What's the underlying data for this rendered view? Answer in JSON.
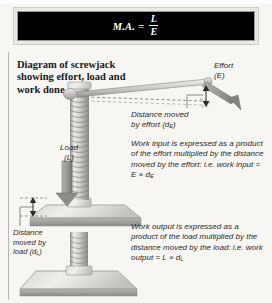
{
  "banner": {
    "formula_lhs": "M.A.",
    "formula_eq": "=",
    "formula_numerator": "L",
    "formula_denominator": "E"
  },
  "title": "Diagram of screwjack showing effort, load and work done",
  "labels": {
    "effort": "Effort (E)",
    "effort_line1": "Effort",
    "effort_line2": "(E)",
    "load_line1": "Load",
    "load_line2": "(L)",
    "distance_moved_by_effort": "Distance moved by effort (dE)",
    "distance_moved_by_load": "Distance moved by load (dL)"
  },
  "paragraphs": {
    "work_input": "Work input is expressed as a product of the effort multiplied by the distance moved by the effort: i.e. work input = E × dE",
    "work_output": "Work output is expressed as a product of the load multiplied by the distance moved by the load: i.e. work output = L × dL"
  },
  "colors": {
    "page_background": "#f7f6f3",
    "banner_background": "#000000",
    "banner_frame": "#e9e8e4",
    "banner_text": "#ffffff",
    "metal_light": "#e4e3e0",
    "metal_mid": "#b9b8b4",
    "metal_dark": "#8d8c88",
    "arrow_gray": "#9a9995",
    "text": "#2b2b2b",
    "rule": "#b9b7b2"
  },
  "diagram": {
    "parts": [
      "screw-shaft",
      "lifting-platform",
      "base-plate",
      "handle-bar",
      "handle-bar-ghost",
      "effort-arrow",
      "load-arrow",
      "effort-travel-arrow",
      "load-travel-arrow"
    ]
  }
}
